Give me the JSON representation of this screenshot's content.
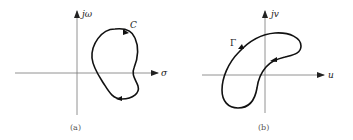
{
  "figures": [
    {
      "id": "a",
      "caption": "(a)",
      "horizontal_axis_label": "σ",
      "vertical_axis_label": "jω",
      "contour_label": "C",
      "arrow_direction": "clockwise"
    },
    {
      "id": "b",
      "caption": "(b)",
      "horizontal_axis_label": "u",
      "vertical_axis_label": "jv",
      "contour_label": "Γ",
      "arrow_direction": "clockwise"
    }
  ],
  "colors": {
    "axis": "#666666",
    "curve": "#111111",
    "text": "#222222"
  }
}
